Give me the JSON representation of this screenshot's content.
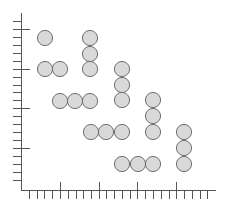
{
  "figure": {
    "type": "dot-grid-diagram",
    "width": 227,
    "height": 207,
    "colors": {
      "background": "#ffffff",
      "axis": "#555555",
      "circle_fill": "#d9d9d9",
      "circle_stroke": "#6e6e6e"
    },
    "axes": {
      "origin": [
        21,
        190
      ],
      "x_end": 216,
      "y_top": 13,
      "x_minor_ticks": [
        29,
        37,
        44,
        52,
        68,
        76,
        83,
        91,
        106,
        114,
        122,
        130,
        145,
        153,
        161,
        169,
        184,
        192,
        200,
        207
      ],
      "x_major_ticks": [
        60,
        99,
        137,
        176
      ],
      "y_minor_ticks": [
        21,
        37,
        45,
        53,
        61,
        77,
        85,
        92,
        100,
        116,
        124,
        132,
        140,
        156,
        164,
        172,
        180
      ],
      "y_major_ticks": [
        29,
        69,
        108,
        148
      ]
    },
    "circle_radius": 7.6,
    "groups": [
      {
        "name": "group-1",
        "circles": [
          [
            45,
            38
          ]
        ]
      },
      {
        "name": "group-2",
        "circles": [
          [
            45,
            69
          ],
          [
            60,
            69
          ]
        ]
      },
      {
        "name": "group-3",
        "circles": [
          [
            90,
            38
          ],
          [
            90,
            54
          ],
          [
            90,
            69
          ]
        ]
      },
      {
        "name": "group-4",
        "circles": [
          [
            60,
            101
          ],
          [
            75,
            101
          ],
          [
            90,
            101
          ]
        ]
      },
      {
        "name": "group-5",
        "circles": [
          [
            122,
            69
          ],
          [
            122,
            85
          ],
          [
            122,
            100
          ]
        ]
      },
      {
        "name": "group-6",
        "circles": [
          [
            91,
            132
          ],
          [
            106,
            132
          ],
          [
            122,
            132
          ]
        ]
      },
      {
        "name": "group-7",
        "circles": [
          [
            153,
            100
          ],
          [
            153,
            116
          ],
          [
            153,
            132
          ]
        ]
      },
      {
        "name": "group-8",
        "circles": [
          [
            122,
            164
          ],
          [
            138,
            164
          ],
          [
            153,
            164
          ]
        ]
      },
      {
        "name": "group-9",
        "circles": [
          [
            184,
            132
          ],
          [
            184,
            148
          ],
          [
            184,
            164
          ]
        ]
      }
    ]
  }
}
